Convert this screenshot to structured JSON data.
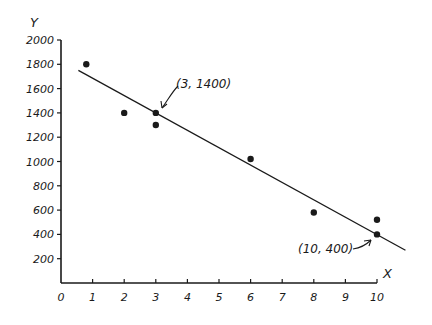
{
  "chart_data": {
    "type": "scatter",
    "title": "",
    "xlabel": "X",
    "ylabel": "Y",
    "xlim": [
      0,
      10
    ],
    "ylim": [
      0,
      2000
    ],
    "x_ticks": [
      "0",
      "1",
      "2",
      "3",
      "4",
      "5",
      "6",
      "7",
      "8",
      "9",
      "10"
    ],
    "y_ticks": [
      "200",
      "400",
      "600",
      "800",
      "1000",
      "1200",
      "1400",
      "1600",
      "1800",
      "2000"
    ],
    "grid": false,
    "legend": null,
    "series": [
      {
        "name": "data points",
        "points": [
          {
            "x": 0.8,
            "y": 1800
          },
          {
            "x": 2,
            "y": 1400
          },
          {
            "x": 3,
            "y": 1400
          },
          {
            "x": 3,
            "y": 1300
          },
          {
            "x": 6,
            "y": 1020
          },
          {
            "x": 8,
            "y": 580
          },
          {
            "x": 10,
            "y": 520
          },
          {
            "x": 10,
            "y": 400
          }
        ]
      }
    ],
    "fit_line": {
      "name": "linear fit",
      "from": {
        "x": 0.55,
        "y": 1750
      },
      "to": {
        "x": 10.9,
        "y": 270
      },
      "passes_through": [
        {
          "x": 3,
          "y": 1400
        },
        {
          "x": 10,
          "y": 400
        }
      ]
    },
    "annotations": [
      {
        "text": "(3, 1400)",
        "x": 3,
        "y": 1400
      },
      {
        "text": "(10, 400)",
        "x": 10,
        "y": 400
      }
    ]
  },
  "labels": {
    "x_axis": "X",
    "y_axis": "Y",
    "annot1": "(3, 1400)",
    "annot2": "(10, 400)"
  },
  "colors": {
    "ink": "#1a1a1a",
    "background": "#ffffff"
  }
}
